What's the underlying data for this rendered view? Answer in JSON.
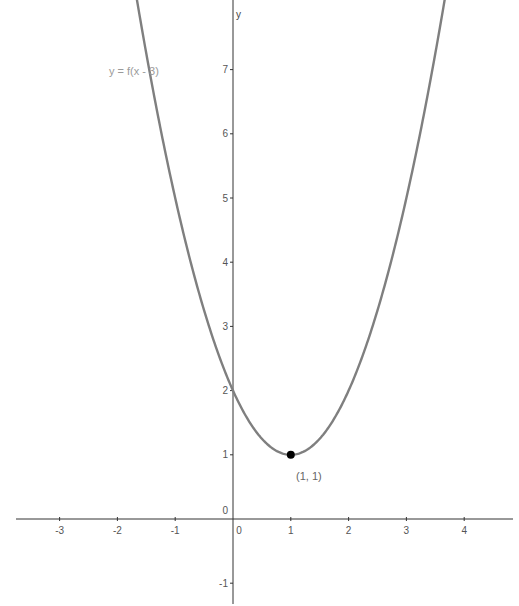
{
  "chart_data": {
    "type": "line",
    "title": "",
    "xlabel": "",
    "ylabel": "y",
    "xlim": [
      -4,
      4.85
    ],
    "ylim": [
      -1.45,
      8.1
    ],
    "grid": false,
    "x_ticks": [
      -3,
      -2,
      -1,
      0,
      1,
      2,
      3,
      4
    ],
    "y_ticks": [
      -1,
      0,
      1,
      2,
      3,
      4,
      5,
      6,
      7
    ],
    "x_tick_labels": [
      "-3",
      "-2",
      "-1",
      "0",
      "1",
      "2",
      "3",
      "4"
    ],
    "y_tick_labels": [
      "-1",
      "0",
      "1",
      "2",
      "3",
      "4",
      "5",
      "6",
      "7"
    ],
    "series": [
      {
        "name": "y = f(x - 3)",
        "expression": "(x - 1)^2 + 1",
        "color": "#7f7f7f",
        "x": [
          -2,
          -1.5,
          -1,
          -0.5,
          0,
          0.5,
          1,
          1.5,
          2,
          2.5,
          3,
          3.5,
          4
        ],
        "values": [
          10,
          7.25,
          5,
          3.25,
          2,
          1.25,
          1,
          1.25,
          2,
          3.25,
          5,
          7.25,
          10
        ]
      }
    ],
    "annotations": [
      {
        "type": "point",
        "x": 1,
        "y": 1,
        "label": "(1, 1)",
        "color": "#000000"
      },
      {
        "type": "text",
        "text": "y = f(x - 3)",
        "near": "curve left branch"
      }
    ]
  },
  "labels": {
    "curve": "y = f(x - 3)",
    "point": "(1, 1)",
    "y_axis": "y",
    "origin_x": "0",
    "origin_y": "0"
  },
  "colors": {
    "axis": "#333333",
    "curve": "#7f7f7f",
    "point": "#000000",
    "curve_label": "#9a9a9a"
  }
}
